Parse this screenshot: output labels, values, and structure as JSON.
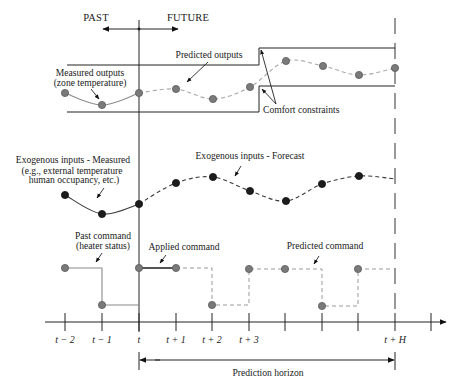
{
  "header": {
    "past_label": "PAST",
    "future_label": "FUTURE"
  },
  "labels": {
    "predicted_outputs": "Predicted outputs",
    "measured_outputs_1": "Measured outputs",
    "measured_outputs_2": "(zone temperature)",
    "comfort_constraints": "Comfort constraints",
    "exo_measured_1": "Exogenous inputs - Measured",
    "exo_measured_2": "(e.g., external temperature",
    "exo_measured_3": "human occupancy, etc.)",
    "exo_forecast": "Exogenous inputs - Forecast",
    "past_command_1": "Past command",
    "past_command_2": "(heater status)",
    "applied_command": "Applied command",
    "predicted_command": "Predicted command",
    "prediction_horizon": "Prediction horizon"
  },
  "axis": {
    "tick_x": [
      65,
      102,
      139,
      176,
      212,
      249,
      285,
      322,
      358,
      395,
      431
    ],
    "tick_labels": [
      {
        "x": 65,
        "label": "t − 2"
      },
      {
        "x": 102,
        "label": "t − 1"
      },
      {
        "x": 139,
        "label": "t"
      },
      {
        "x": 176,
        "label": "t + 1"
      },
      {
        "x": 212,
        "label": "t + 2"
      },
      {
        "x": 249,
        "label": "t + 3"
      },
      {
        "x": 395,
        "label": "t + H"
      }
    ]
  },
  "diagram_data": {
    "outputs_measured": [
      [
        65,
        93
      ],
      [
        102,
        105
      ],
      [
        139,
        93
      ]
    ],
    "outputs_predicted": [
      [
        139,
        93
      ],
      [
        176,
        89
      ],
      [
        213,
        99
      ],
      [
        250,
        87
      ],
      [
        286,
        61
      ],
      [
        323,
        66
      ],
      [
        359,
        75
      ],
      [
        395,
        68
      ]
    ],
    "exo_measured": [
      [
        65,
        195
      ],
      [
        102,
        214
      ],
      [
        139,
        204
      ]
    ],
    "exo_forecast": [
      [
        139,
        204
      ],
      [
        176,
        183
      ],
      [
        213,
        177
      ],
      [
        250,
        191
      ],
      [
        286,
        201
      ],
      [
        322,
        184
      ],
      [
        359,
        176
      ],
      [
        395,
        179
      ]
    ],
    "command_points": [
      [
        65,
        268
      ],
      [
        102,
        305
      ],
      [
        139,
        268
      ],
      [
        176,
        268
      ],
      [
        212,
        305
      ],
      [
        249,
        269
      ],
      [
        285,
        269
      ],
      [
        322,
        306
      ],
      [
        358,
        269
      ]
    ],
    "comfort_upper": [
      [
        67,
        65
      ],
      [
        259,
        65
      ],
      [
        259,
        48
      ],
      [
        395,
        48
      ]
    ],
    "comfort_lower": [
      [
        67,
        112
      ],
      [
        259,
        112
      ],
      [
        259,
        86
      ],
      [
        395,
        86
      ]
    ]
  }
}
